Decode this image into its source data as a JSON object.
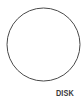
{
  "figure": {
    "type": "schematic-diagram",
    "width": 84,
    "height": 102,
    "background_color": "#ffffff",
    "stroke_color": "#4a4a4a",
    "label_color": "#3a3a3a",
    "shapes": [
      {
        "name": "disk-outline",
        "kind": "circle",
        "center_x": 43.5,
        "center_y": 44.5,
        "radius": 36.5,
        "fill": "#ffffff",
        "stroke": "#4a4a4a",
        "stroke_width": 1
      }
    ],
    "labels": [
      {
        "name": "disk-label",
        "text": "DISK",
        "x": 65,
        "y": 93
      }
    ]
  }
}
